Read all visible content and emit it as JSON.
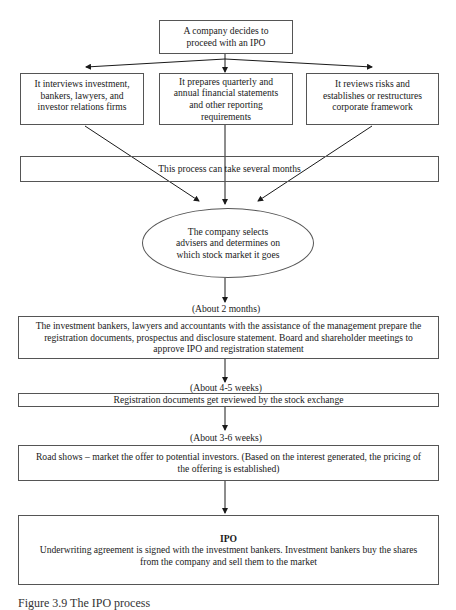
{
  "diagram": {
    "type": "flowchart",
    "title": "The IPO process",
    "caption": "Figure 3.9 The IPO process",
    "start": {
      "text": "A company decides to proceed with an IPO",
      "lines": [
        "A company decides to",
        "proceed with an IPO"
      ]
    },
    "branches": [
      {
        "id": "interviews",
        "lines": [
          "It interviews investment,",
          "bankers, lawyers, and",
          "investor relations firms"
        ],
        "text": "It interviews investment, bankers, lawyers, and investor relations firms"
      },
      {
        "id": "prepares",
        "lines": [
          "It prepares quarterly and",
          "annual financial statements",
          "and other reporting",
          "requirements"
        ],
        "text": "It prepares quarterly and annual financial statements and other reporting requirements"
      },
      {
        "id": "reviews",
        "lines": [
          "It reviews risks and",
          "establishes or restructures",
          "corporate framework"
        ],
        "text": "It reviews risks and establishes or restructures corporate framework"
      }
    ],
    "duration_note": {
      "text": "This process can take several months"
    },
    "decision": {
      "shape": "ellipse",
      "lines": [
        "The company selects",
        "advisers and determines on",
        "which stock market it goes"
      ],
      "text": "The company selects advisers and determines on which stock market it goes"
    },
    "steps": [
      {
        "time_label": "(About 2 months)",
        "lines": [
          "The investment bankers, lawyers and accountants with the assistance of the management prepare the",
          "registration documents, prospectus and disclosure statement. Board and shareholder meetings to",
          "approve IPO and registration statement"
        ]
      },
      {
        "time_label": "(About 4-5 weeks)",
        "lines": [
          "Registration documents get reviewed by the stock exchange"
        ]
      },
      {
        "time_label": "(About 3-6 weeks)",
        "lines": [
          "Road shows – market the offer to potential investors. (Based on the interest generated, the pricing of",
          "the offering is established)"
        ]
      }
    ],
    "final": {
      "title": "IPO",
      "lines": [
        "Underwriting agreement is signed with the investment bankers. Investment bankers buy the shares",
        "from the company and sell them to the market"
      ]
    },
    "colors": {
      "line": "#1a1a1a",
      "border": "#555555",
      "background": "#ffffff",
      "text": "#1a1a1a"
    }
  }
}
